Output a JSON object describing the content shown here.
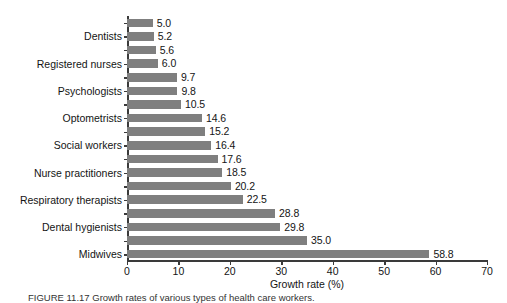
{
  "figure": {
    "caption": "FIGURE 11.17  Growth rates of various types of health care workers.",
    "background_color": "#ffffff",
    "bar_color": "#7f7f7f",
    "axis_color": "#3a3a3a",
    "text_color": "#141414"
  },
  "chart_data": {
    "type": "bar",
    "orientation": "horizontal",
    "title": "",
    "subtitle": "",
    "xlabel": "Growth rate (%)",
    "ylabel": "",
    "xlim": [
      0,
      70
    ],
    "xticks": [
      0,
      10,
      20,
      30,
      40,
      50,
      60,
      70
    ],
    "xtick_labels": [
      "0",
      "10",
      "20",
      "30",
      "40",
      "50",
      "60",
      "70"
    ],
    "grid": false,
    "legend": null,
    "value_labels_shown": true,
    "categories": [
      "",
      "Dentists",
      "",
      "Registered nurses",
      "",
      "Psychologists",
      "",
      "Optometrists",
      "",
      "Social workers",
      "",
      "Nurse practitioners",
      "",
      "Respiratory therapists",
      "",
      "Dental hygienists",
      "",
      "Midwives"
    ],
    "values": [
      5.0,
      5.2,
      5.6,
      6.0,
      9.7,
      9.8,
      10.5,
      14.6,
      15.2,
      16.4,
      17.6,
      18.5,
      20.2,
      22.5,
      28.8,
      29.8,
      35.0,
      58.8
    ],
    "value_label_texts": [
      "5.0",
      "5.2",
      "5.6",
      "6.0",
      "9.7",
      "9.8",
      "10.5",
      "14.6",
      "15.2",
      "16.4",
      "17.6",
      "18.5",
      "20.2",
      "22.5",
      "28.8",
      "29.8",
      "35.0",
      "58.8"
    ],
    "visible_category_labels": [
      "Dentists",
      "Registered nurses",
      "Psychologists",
      "Optometrists",
      "Social workers",
      "Nurse practitioners",
      "Respiratory therapists",
      "Dental hygienists",
      "Midwives"
    ],
    "note": "Category tick labels are printed on every second bar only (bars 2, 4, 6, 8, 10, 12, 14, 16, 18 counting from the top)."
  }
}
